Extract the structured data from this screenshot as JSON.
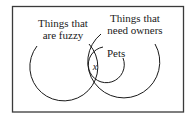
{
  "diagram": {
    "type": "venn",
    "sets": [
      {
        "id": "fuzzy",
        "label_lines": [
          "Things that",
          "are fuzzy"
        ]
      },
      {
        "id": "owners",
        "label_lines": [
          "Things that",
          "need owners"
        ]
      },
      {
        "id": "pets",
        "label_lines": [
          "Pets"
        ]
      }
    ],
    "region_marker": "x",
    "colors": {
      "stroke": "#1a1a1a",
      "frame": "#3a3a3a",
      "background": "#ffffff"
    }
  }
}
